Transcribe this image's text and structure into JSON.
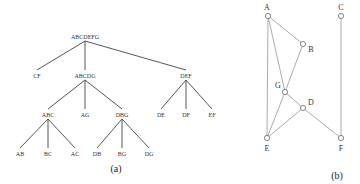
{
  "figure_a": {
    "caption": "(a)",
    "nodes": {
      "root": {
        "label": "ABCDEFG",
        "x": 85,
        "y": 37
      },
      "cf": {
        "label": "CF",
        "x": 37,
        "y": 76
      },
      "abcdg": {
        "label": "ABCDG",
        "x": 85,
        "y": 76
      },
      "def": {
        "label": "DEF",
        "x": 186,
        "y": 76
      },
      "abc": {
        "label": "ABC",
        "x": 48,
        "y": 115
      },
      "ag": {
        "label": "AG",
        "x": 85,
        "y": 115
      },
      "dbg": {
        "label": "DBG",
        "x": 122,
        "y": 115
      },
      "de": {
        "label": "DE",
        "x": 161,
        "y": 115
      },
      "df": {
        "label": "DF",
        "x": 186,
        "y": 115
      },
      "ef": {
        "label": "EF",
        "x": 212,
        "y": 115
      },
      "ab": {
        "label": "AB",
        "x": 20,
        "y": 154
      },
      "bc": {
        "label": "BC",
        "x": 48,
        "y": 154
      },
      "ac": {
        "label": "AC",
        "x": 75,
        "y": 154
      },
      "db": {
        "label": "DB",
        "x": 97,
        "y": 154
      },
      "bg": {
        "label": "BG",
        "x": 122,
        "y": 154
      },
      "dg": {
        "label": "DG",
        "x": 149,
        "y": 154
      }
    },
    "edges": [
      [
        "root",
        "cf"
      ],
      [
        "root",
        "abcdg"
      ],
      [
        "root",
        "def"
      ],
      [
        "abcdg",
        "abc"
      ],
      [
        "abcdg",
        "ag"
      ],
      [
        "abcdg",
        "dbg"
      ],
      [
        "def",
        "de"
      ],
      [
        "def",
        "df"
      ],
      [
        "def",
        "ef"
      ],
      [
        "abc",
        "ab"
      ],
      [
        "abc",
        "bc"
      ],
      [
        "abc",
        "ac"
      ],
      [
        "dbg",
        "db"
      ],
      [
        "dbg",
        "bg"
      ],
      [
        "dbg",
        "dg"
      ]
    ]
  },
  "figure_b": {
    "caption": "(b)",
    "nodes": {
      "A": {
        "label": "A",
        "x": 268,
        "y": 16
      },
      "B": {
        "label": "B",
        "x": 303,
        "y": 44
      },
      "C": {
        "label": "C",
        "x": 341,
        "y": 16
      },
      "G": {
        "label": "G",
        "x": 285,
        "y": 92
      },
      "D": {
        "label": "D",
        "x": 303,
        "y": 108
      },
      "E": {
        "label": "E",
        "x": 267,
        "y": 138
      },
      "F": {
        "label": "F",
        "x": 341,
        "y": 138
      }
    },
    "edges": [
      [
        "A",
        "B"
      ],
      [
        "A",
        "G"
      ],
      [
        "A",
        "E"
      ],
      [
        "B",
        "G"
      ],
      [
        "G",
        "D"
      ],
      [
        "G",
        "E"
      ],
      [
        "D",
        "E"
      ],
      [
        "D",
        "F"
      ],
      [
        "C",
        "F"
      ]
    ]
  }
}
